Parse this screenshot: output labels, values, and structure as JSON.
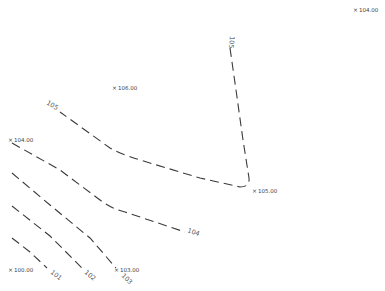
{
  "map": {
    "type": "contour-plan",
    "line_color": "#3a3a3a",
    "text_color": "#555555",
    "contour_labels": [
      "101",
      "102",
      "103",
      "104",
      "105",
      "105"
    ],
    "spot_elevations": [
      {
        "label": "104.00"
      },
      {
        "label": "106.00"
      },
      {
        "label": "104.00"
      },
      {
        "label": "105.00"
      },
      {
        "label": "100.00"
      },
      {
        "label": "103.00"
      }
    ]
  }
}
